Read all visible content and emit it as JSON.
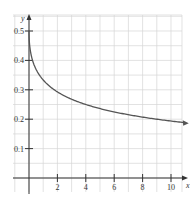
{
  "chart_data": {
    "type": "line",
    "title": "",
    "xlabel": "x",
    "ylabel": "y",
    "xlim": [
      -1,
      11
    ],
    "ylim": [
      -0.05,
      0.55
    ],
    "grid": true,
    "x_ticks": [
      2,
      4,
      6,
      8,
      10
    ],
    "x_tick_labels": [
      "2",
      "4",
      "6",
      "8",
      "10"
    ],
    "y_ticks": [
      0.1,
      0.2,
      0.3,
      0.4,
      0.5
    ],
    "y_tick_labels": [
      "0.1",
      "0.2",
      "0.3",
      "0.4",
      "0.5"
    ],
    "series": [
      {
        "name": "curve",
        "x": [
          0,
          0.25,
          0.5,
          1,
          2,
          3,
          4,
          5,
          6,
          7,
          8,
          9,
          10,
          11
        ],
        "y": [
          0.5,
          0.4,
          0.37,
          0.333,
          0.293,
          0.268,
          0.25,
          0.236,
          0.225,
          0.216,
          0.207,
          0.2,
          0.194,
          0.188
        ],
        "end_arrow": true
      }
    ],
    "colors": {
      "curve": "#555555",
      "axis": "#333333",
      "grid": "#d6d6d6"
    }
  }
}
